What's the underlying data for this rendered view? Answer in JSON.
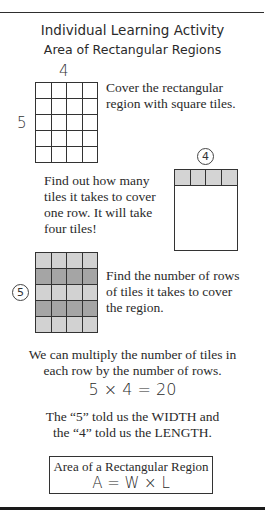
{
  "header": {
    "title": "Individual Learning Activity",
    "subtitle": "Area of Rectangular Regions"
  },
  "step1": {
    "top_label": "4",
    "side_label": "5",
    "grid": {
      "columns": 4,
      "rows": 5
    },
    "text_line1": "Cover the rectangular",
    "text_line2": "region with square tiles."
  },
  "step2": {
    "text_lines": [
      "Find out how many",
      "tiles it takes to cover",
      "one row. It will take",
      "four tiles!"
    ],
    "circle_label": "4",
    "shaded_row_color": "#d4d4d4"
  },
  "step3": {
    "circle_label": "5",
    "text_lines": [
      "Find the number of rows",
      "of tiles it takes to cover",
      "the region."
    ],
    "row_colors": [
      "#d2d2d2",
      "#a5a5a5",
      "#d2d2d2",
      "#a5a5a5",
      "#d2d2d2"
    ]
  },
  "explanation": {
    "line1": "We can multiply the number of tiles in",
    "line2": "each row by the number of rows.",
    "equation": "5 × 4 = 20",
    "line3": "The “5” told us the WIDTH and",
    "line4": "the “4” told us the LENGTH."
  },
  "formula": {
    "title": "Area of a Rectangular Region",
    "equation": "A = W × L"
  }
}
